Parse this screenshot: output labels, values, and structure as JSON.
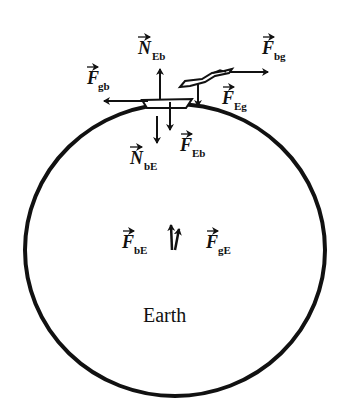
{
  "diagram": {
    "type": "free-body-diagram",
    "colors": {
      "stroke": "#111111",
      "background": "#ffffff"
    },
    "earth": {
      "label": "Earth"
    },
    "objects": [
      {
        "id": "block",
        "name": "block on Earth's surface"
      },
      {
        "id": "girl",
        "name": "person pulling rope"
      }
    ],
    "forces": [
      {
        "id": "N_Eb",
        "symbol": "N",
        "subscript": "Eb",
        "direction": "up"
      },
      {
        "id": "F_gb",
        "symbol": "F",
        "subscript": "gb",
        "direction": "left"
      },
      {
        "id": "F_bg",
        "symbol": "F",
        "subscript": "bg",
        "direction": "right"
      },
      {
        "id": "F_Eg",
        "symbol": "F",
        "subscript": "Eg",
        "direction": "down"
      },
      {
        "id": "N_bE",
        "symbol": "N",
        "subscript": "bE",
        "direction": "down"
      },
      {
        "id": "F_Eb",
        "symbol": "F",
        "subscript": "Eb",
        "direction": "down"
      },
      {
        "id": "F_bE",
        "symbol": "F",
        "subscript": "bE",
        "direction": "up"
      },
      {
        "id": "F_gE",
        "symbol": "F",
        "subscript": "gE",
        "direction": "up"
      }
    ]
  }
}
